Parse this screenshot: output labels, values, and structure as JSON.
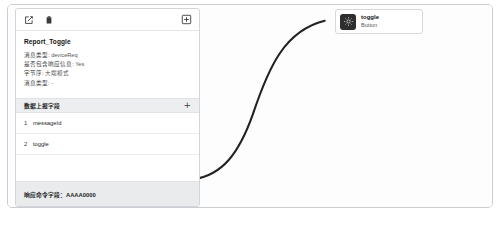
{
  "card": {
    "toolbar": {
      "edit_icon": "edit-square-icon",
      "delete_icon": "trash-icon",
      "add_icon": "add-box-icon"
    },
    "title": "Report_Toggle",
    "meta": [
      {
        "label": "消息类型:",
        "value": "deviceReq"
      },
      {
        "label": "是否包含响应信息:",
        "value": "Yes"
      },
      {
        "label": "字节序:",
        "value": "大端模式"
      },
      {
        "label": "消息类型:",
        "value": "-"
      }
    ],
    "fields_section": {
      "header_label": "数据上报字段",
      "add_label": "+",
      "rows": [
        {
          "index": "1",
          "name": "messageId"
        },
        {
          "index": "2",
          "name": "toggle"
        }
      ]
    },
    "footer_label": "响应命令字段：AAAA0000"
  },
  "node": {
    "icon": "widget-icon",
    "title": "toggle",
    "subtitle": "Button"
  },
  "edge": {
    "name": "connector-edge",
    "color": "#222222"
  }
}
